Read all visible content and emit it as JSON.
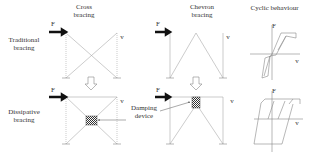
{
  "columns": {
    "cross": "Cross\nbracing",
    "cross_l1": "Cross",
    "cross_l2": "bracing",
    "chevron_l1": "Chevron",
    "chevron_l2": "bracing",
    "cyclic": "Cyclic behaviour"
  },
  "rows": {
    "traditional_l1": "Traditional",
    "traditional_l2": "bracing",
    "dissipative_l1": "Dissipative",
    "dissipative_l2": "bracing"
  },
  "annotations": {
    "damping_l1": "Damping",
    "damping_l2": "device"
  },
  "symbols": {
    "force": "F",
    "displacement": "v"
  }
}
